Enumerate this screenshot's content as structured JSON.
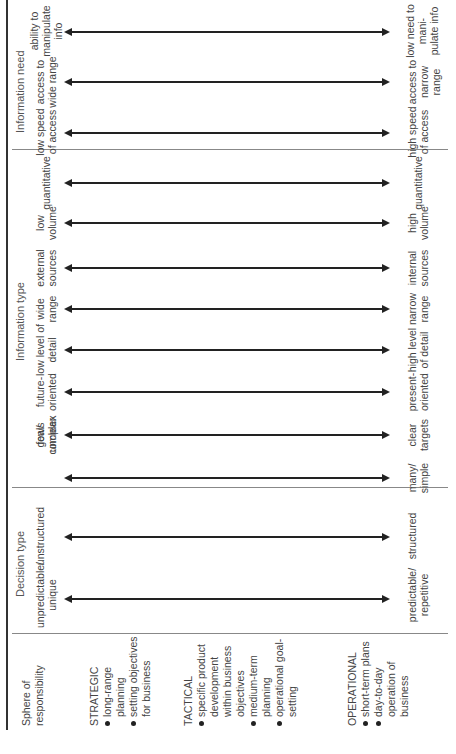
{
  "diagram": {
    "orientation": "rotated-90-ccw",
    "sphere": {
      "header": "Sphere of responsibility",
      "levels": [
        {
          "name": "STRATEGIC",
          "bullets": [
            "long-range planning",
            "setting objectives for business"
          ]
        },
        {
          "name": "TACTICAL",
          "bullets": [
            "specific product development within business objectives",
            "medium-term planning",
            "operational goal-setting"
          ]
        },
        {
          "name": "OPERATIONAL",
          "bullets": [
            "short-term plans",
            "day-to-day operation of business"
          ]
        }
      ]
    },
    "groups": [
      {
        "title": "Decision type",
        "scales": [
          {
            "top": "unpredictable/ unique",
            "bottom": "predictable/ repetitive"
          },
          {
            "top": "unstructured",
            "bottom": "structured"
          }
        ]
      },
      {
        "title": "Information type",
        "scales": [
          {
            "top": "few/ complex",
            "bottom": "many/ simple"
          },
          {
            "top": "goals unclear",
            "bottom": "clear targets"
          },
          {
            "top": "future- oriented",
            "bottom": "present- oriented"
          },
          {
            "top": "low level of detail",
            "bottom": "high level of detail"
          },
          {
            "top": "wide range",
            "bottom": "narrow range"
          },
          {
            "top": "external sources",
            "bottom": "internal sources"
          },
          {
            "top": "low volume",
            "bottom": "high volume"
          },
          {
            "top": "quantitative",
            "bottom": "quantitative"
          }
        ]
      },
      {
        "title": "Information need",
        "scales": [
          {
            "top": "low speed of access",
            "bottom": "high speed of access"
          },
          {
            "top": "access to wide range",
            "bottom": "access to narrow range"
          },
          {
            "top": "ability to manipulate info",
            "bottom": "low need to mani- pulate info"
          }
        ]
      }
    ],
    "colors": {
      "line": "#222222",
      "text": "#444444",
      "separator": "#888888"
    }
  }
}
